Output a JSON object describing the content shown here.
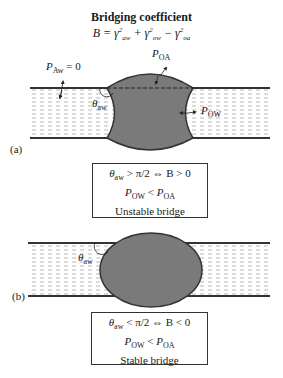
{
  "header": {
    "title": "Bridging coefficient",
    "formula": "B = γ²aw + γ²ow − γ²oa"
  },
  "panel_a": {
    "tag": "(a)",
    "labels": {
      "p_aw": "P",
      "p_aw_sub": "Aw",
      "p_aw_eq": " = 0",
      "p_oa": "P",
      "p_oa_sub": "OA",
      "p_ow": "P",
      "p_ow_sub": "OW",
      "theta": "θ",
      "theta_sub": "aw"
    },
    "box": {
      "line1_theta": "θ",
      "line1_sub": "aw",
      "line1_rest": " > π/2 ⇔ B > 0",
      "line2_p1": "P",
      "line2_p1_sub": "OW",
      "line2_op": " < ",
      "line2_p2": "P",
      "line2_p2_sub": "OA",
      "line3": "Unstable bridge"
    }
  },
  "panel_b": {
    "tag": "(b)",
    "labels": {
      "theta": "θ",
      "theta_sub": "aw"
    },
    "box": {
      "line1_theta": "θ",
      "line1_sub": "aw",
      "line1_rest": " < π/2 ⇔ B < 0",
      "line2_p1": "P",
      "line2_p1_sub": "OW",
      "line2_op": " < ",
      "line2_p2": "P",
      "line2_p2_sub": "OA",
      "line3": "Stable bridge"
    }
  },
  "colors": {
    "oil_drop": "#7a7a7a",
    "film_lines": "#333333",
    "water_dash": "#9a9a9a"
  }
}
